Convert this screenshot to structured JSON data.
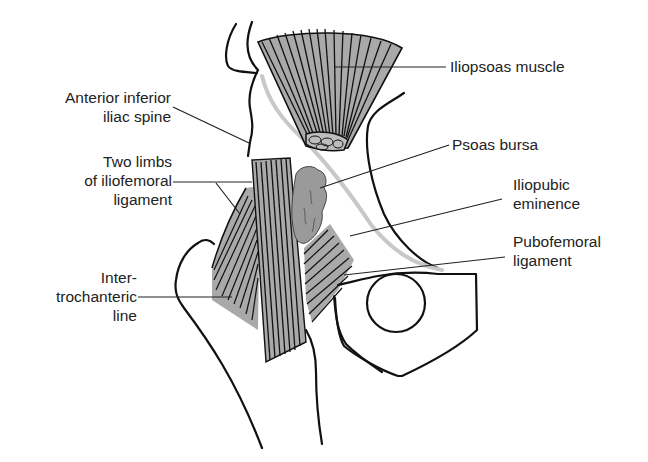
{
  "figure": {
    "colors": {
      "outline": "#111111",
      "muscle_fill": "#a9a9a9",
      "bursa_fill": "#9a9a9a",
      "rim_gray": "#c8c8c8",
      "background": "#ffffff",
      "text": "#222222"
    }
  },
  "labels": {
    "iliopsoas": {
      "lines": [
        "Iliopsoas muscle"
      ]
    },
    "aiis": {
      "lines": [
        "Anterior inferior",
        "iliac spine"
      ]
    },
    "psoas_bursa": {
      "lines": [
        "Psoas bursa"
      ]
    },
    "iliofemoral": {
      "lines": [
        "Two limbs",
        "of iliofemoral",
        "ligament"
      ]
    },
    "iliopubic": {
      "lines": [
        "Iliopubic",
        "eminence"
      ]
    },
    "pubofemoral": {
      "lines": [
        "Pubofemoral",
        "ligament"
      ]
    },
    "intertrochanteric": {
      "lines": [
        "Inter-",
        "trochanteric",
        "line"
      ]
    }
  }
}
